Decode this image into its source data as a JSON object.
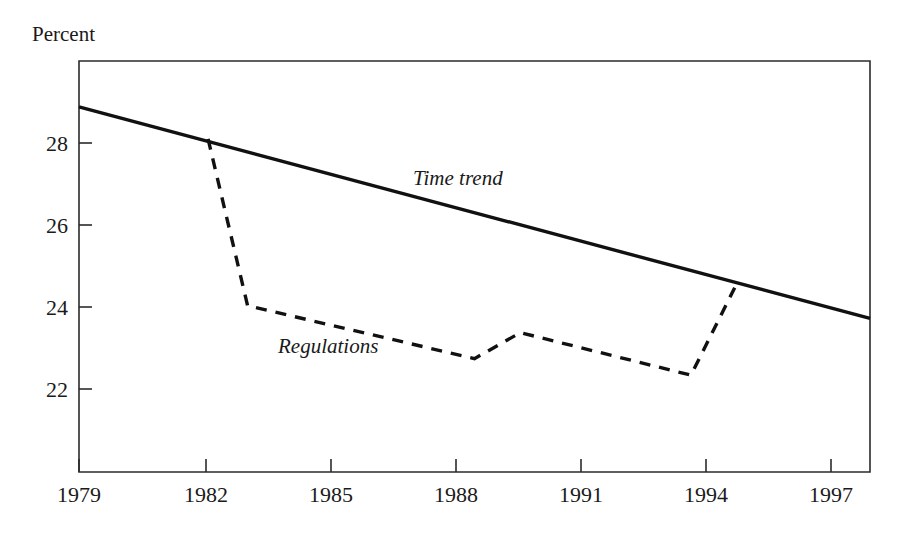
{
  "chart_data": {
    "type": "line",
    "title": "",
    "subtitle": "",
    "ylabel": "Percent",
    "xlabel": "",
    "grid": false,
    "legend_position": "inline-annotation",
    "xlim": [
      1979,
      1998
    ],
    "ylim": [
      20.9,
      29.6
    ],
    "xticks": [
      1979,
      1982,
      1985,
      1988,
      1991,
      1994,
      1997
    ],
    "xtick_labels": [
      "1979",
      "1982",
      "1985",
      "1988",
      "1991",
      "1994",
      "1997"
    ],
    "yticks": [
      22,
      24,
      26,
      28
    ],
    "ytick_labels": [
      "22",
      "24",
      "26",
      "28"
    ],
    "series": [
      {
        "name": "Time trend",
        "style": "solid",
        "label": "Time trend",
        "label_x": 1988.8,
        "label_y": 27.05,
        "x": [
          1979.0,
          1998.0
        ],
        "values": [
          28.63,
          24.15
        ]
      },
      {
        "name": "Regulations",
        "style": "dashed",
        "label": "Regulations",
        "label_x": 1984.4,
        "label_y": 23.0,
        "x": [
          1982.1,
          1983.05,
          1988.5,
          1989.6,
          1993.7,
          1994.75
        ],
        "values": [
          27.95,
          24.42,
          23.3,
          23.85,
          22.95,
          24.8
        ]
      }
    ],
    "annotations": [
      {
        "text": "Percent",
        "x_px": 32,
        "y_px": 41
      },
      {
        "text": "Time trend",
        "x_px": 413,
        "y_px": 185
      },
      {
        "text": "Regulations",
        "x_px": 278,
        "y_px": 353
      }
    ]
  },
  "axis": {
    "y_axis_caption": "Percent"
  }
}
